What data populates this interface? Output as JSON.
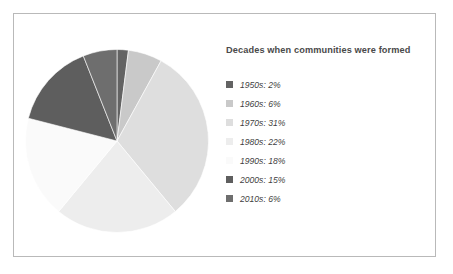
{
  "chart_data": {
    "type": "pie",
    "title": "Decades when communities were formed",
    "categories": [
      "1950s",
      "1960s",
      "1970s",
      "1980s",
      "1990s",
      "2000s",
      "2010s"
    ],
    "values": [
      2,
      6,
      31,
      22,
      18,
      15,
      6
    ],
    "unit": "%",
    "start_angle_deg": 0,
    "direction": "clockwise",
    "legend_position": "right",
    "grid": false,
    "slices": [
      {
        "label": "1950s",
        "value": 2,
        "legend_text": "1950s: 2%",
        "color": "#636363"
      },
      {
        "label": "1960s",
        "value": 6,
        "legend_text": "1960s: 6%",
        "color": "#c9c9c9"
      },
      {
        "label": "1970s",
        "value": 31,
        "legend_text": "1970s: 31%",
        "color": "#dedede"
      },
      {
        "label": "1980s",
        "value": 22,
        "legend_text": "1980s: 22%",
        "color": "#ededed"
      },
      {
        "label": "1990s",
        "value": 18,
        "legend_text": "1990s: 18%",
        "color": "#fafafa"
      },
      {
        "label": "2000s",
        "value": 15,
        "legend_text": "2000s: 15%",
        "color": "#5e5e5e"
      },
      {
        "label": "2010s",
        "value": 6,
        "legend_text": "2010s: 6%",
        "color": "#6e6e6e"
      }
    ]
  },
  "colors": {
    "frame_border": "#b9b9b9",
    "background": "#ffffff",
    "title_text": "#4a4a4a",
    "legend_text": "#3f3f3f"
  }
}
